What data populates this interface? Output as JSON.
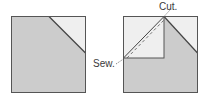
{
  "diagram": {
    "left_square": {
      "fill_dark": "#cccccc",
      "fill_light": "#efefef",
      "stroke": "#555555"
    },
    "right_square": {
      "fill_dark": "#cccccc",
      "fill_light": "#efefef",
      "stroke": "#555555"
    },
    "labels": {
      "cut": "Cut.",
      "sew": "Sew."
    }
  }
}
